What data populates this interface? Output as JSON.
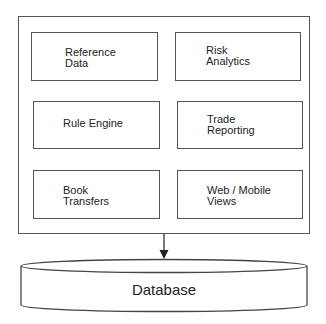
{
  "diagram": {
    "container": {
      "modules": [
        {
          "id": "reference-data",
          "label_line1": "Reference",
          "label_line2": "Data"
        },
        {
          "id": "risk-analytics",
          "label_line1": "Risk",
          "label_line2": "Analytics"
        },
        {
          "id": "rule-engine",
          "label_line1": "Rule Engine",
          "label_line2": ""
        },
        {
          "id": "trade-reporting",
          "label_line1": "Trade",
          "label_line2": "Reporting"
        },
        {
          "id": "book-transfers",
          "label_line1": "Book",
          "label_line2": "Transfers"
        },
        {
          "id": "web-mobile-views",
          "label_line1": "Web / Mobile",
          "label_line2": "Views"
        }
      ]
    },
    "connector": {
      "from": "container",
      "to": "database",
      "type": "arrow"
    },
    "database": {
      "label": "Database"
    },
    "colors": {
      "stroke": "#555555",
      "text": "#222222",
      "background": "#ffffff"
    }
  }
}
